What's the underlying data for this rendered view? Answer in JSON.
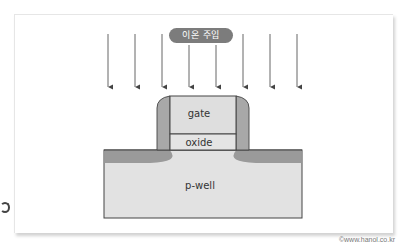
{
  "diagram": {
    "title_label": "이온 주입",
    "layers": {
      "gate": "gate",
      "oxide": "oxide",
      "substrate": "p-well"
    },
    "arrow_count": 8,
    "arrow_x_positions": [
      108,
      135,
      162,
      189,
      216,
      243,
      270,
      297
    ],
    "colors": {
      "label_pill": "#7c7c7c",
      "gate_fill": "#dedede",
      "oxide_fill": "#e4e4e4",
      "spacer_fill": "#a8a8a8",
      "doped_region": "#9a9a9a",
      "pwell_fill": "#e2e2e2",
      "outline": "#444444"
    }
  },
  "footer": {
    "copyright": "©www.hanol.co.kr"
  }
}
